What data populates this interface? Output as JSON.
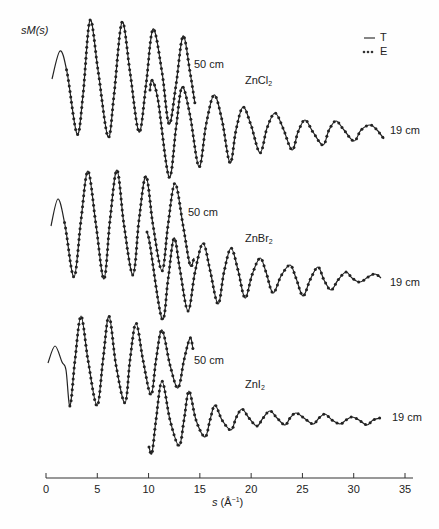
{
  "chart_data": {
    "type": "line",
    "title": "",
    "xlabel": "s (Å⁻¹)",
    "ylabel": "sM(s)",
    "xlim": [
      0,
      35
    ],
    "xticks": [
      0,
      5,
      10,
      15,
      20,
      25,
      30,
      35
    ],
    "grid": false,
    "legend": {
      "position": "top-right",
      "entries": [
        {
          "style": "solid",
          "label": "T"
        },
        {
          "style": "dotted",
          "label": "E"
        }
      ]
    },
    "panels": [
      {
        "compound": "ZnCl2",
        "series": [
          {
            "name": "50 cm",
            "s_range": [
              0.5,
              14.5
            ],
            "peaks_s": [
              1.4,
              4.3,
              7.4,
              10.4,
              13.3
            ],
            "troughs_s": [
              3.0,
              6.0,
              9.1,
              12.0
            ]
          },
          {
            "name": "19 cm",
            "s_range": [
              10.0,
              33.0
            ],
            "peaks_s": [
              10.3,
              13.3,
              16.4,
              19.2,
              22.3,
              25.3,
              28.3,
              31.6
            ],
            "troughs_s": [
              12.0,
              14.9,
              17.9,
              20.9,
              23.9,
              27.0,
              30.0
            ]
          }
        ]
      },
      {
        "compound": "ZnBr2",
        "series": [
          {
            "name": "50 cm",
            "s_range": [
              0.5,
              14.5
            ],
            "peaks_s": [
              1.2,
              4.1,
              6.9,
              9.7,
              12.6
            ],
            "troughs_s": [
              2.7,
              5.6,
              8.5,
              11.3
            ]
          },
          {
            "name": "19 cm",
            "s_range": [
              9.8,
              32.6
            ],
            "peaks_s": [
              12.5,
              15.3,
              18.0,
              20.9,
              23.8,
              26.5,
              29.3,
              32.1
            ],
            "troughs_s": [
              11.3,
              14.2,
              17.2,
              19.4,
              22.1,
              25.1,
              27.8
            ]
          }
        ]
      },
      {
        "compound": "ZnI2",
        "series": [
          {
            "name": "50 cm",
            "s_range": [
              0.2,
              14.3
            ],
            "peaks_s": [
              0.9,
              3.4,
              6.1,
              8.8,
              11.3,
              14.0
            ],
            "troughs_s": [
              2.3,
              5.0,
              7.7,
              10.2,
              12.9
            ]
          },
          {
            "name": "19 cm",
            "s_range": [
              10.0,
              32.5
            ],
            "peaks_s": [
              11.3,
              13.9,
              16.5,
              19.1,
              21.8,
              24.4,
              27.2,
              29.8,
              32.5
            ],
            "troughs_s": [
              12.9,
              15.5,
              18.0,
              20.6,
              23.3,
              26.1,
              28.7,
              31.3
            ]
          }
        ]
      }
    ]
  },
  "labels": {
    "ylabel": "sM(s)",
    "legend_T": "T",
    "legend_E": "E",
    "zncl2": "ZnCl",
    "znbr2": "ZnBr",
    "zni2": "ZnI",
    "sub2": "2",
    "cm50": "50 cm",
    "cm19": "19 cm",
    "xlabel_s": "s",
    "xlabel_unit_open": " (Å",
    "xlabel_exp": "−1",
    "xlabel_close": ")"
  },
  "ticks": [
    "0",
    "5",
    "10",
    "15",
    "20",
    "25",
    "30",
    "35"
  ],
  "colors": {
    "ink": "#222222",
    "background": "#fefefe"
  }
}
